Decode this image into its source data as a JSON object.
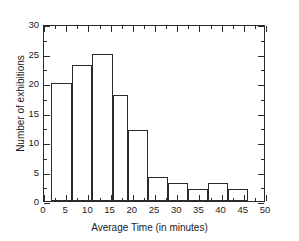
{
  "chart_data": {
    "type": "bar",
    "title": "",
    "xlabel": "Average Time (in minutes)",
    "ylabel": "Number of exhibitions",
    "xlim": [
      0,
      50
    ],
    "ylim": [
      0,
      30
    ],
    "grid": false,
    "legend": null,
    "bin_edges": [
      1.5,
      6.2,
      10.9,
      15.6,
      23.5,
      28.0,
      32.5,
      37.0,
      41.5,
      46.0
    ],
    "bins": [
      {
        "start": 1.5,
        "end": 6.2,
        "value": 20
      },
      {
        "start": 6.2,
        "end": 10.9,
        "value": 23
      },
      {
        "start": 10.9,
        "end": 15.6,
        "value": 25
      },
      {
        "start": 15.6,
        "end": 19.0,
        "value": 18
      },
      {
        "start": 19.0,
        "end": 23.5,
        "value": 12
      },
      {
        "start": 23.5,
        "end": 28.0,
        "value": 4
      },
      {
        "start": 28.0,
        "end": 32.5,
        "value": 3
      },
      {
        "start": 32.5,
        "end": 37.0,
        "value": 2
      },
      {
        "start": 37.0,
        "end": 41.5,
        "value": 3
      },
      {
        "start": 41.5,
        "end": 46.0,
        "value": 2
      }
    ],
    "values": [
      20,
      23,
      25,
      18,
      12,
      4,
      3,
      2,
      3,
      2
    ],
    "categories": [
      "1.5-6.2",
      "6.2-10.9",
      "10.9-15.6",
      "15.6-19",
      "19-23.5",
      "23.5-28",
      "28-32.5",
      "32.5-37",
      "37-41.5",
      "41.5-46"
    ],
    "xticks": [
      0,
      5,
      10,
      15,
      20,
      25,
      30,
      35,
      40,
      45,
      50
    ],
    "xtick_labels": [
      "0",
      "5",
      "10",
      "15",
      "20",
      "25",
      "30",
      "35",
      "40",
      "45",
      "50"
    ],
    "xminor_ticks": [
      2.5,
      7.5,
      12.5,
      17.5,
      22.5,
      27.5,
      32.5,
      37.5,
      42.5,
      47.5
    ],
    "yticks": [
      0,
      5,
      10,
      15,
      20,
      25,
      30
    ],
    "ytick_labels": [
      "0",
      "5",
      "10",
      "15",
      "20",
      "25",
      "30"
    ],
    "yminor_ticks": [
      2.5,
      7.5,
      12.5,
      17.5,
      22.5,
      27.5
    ],
    "colors": {
      "bar_fill": "#ffffff",
      "bar_edge": "#2b2b2b",
      "axis": "#2b2b2b",
      "text": "#1a1a1a",
      "background": "#ffffff"
    }
  }
}
